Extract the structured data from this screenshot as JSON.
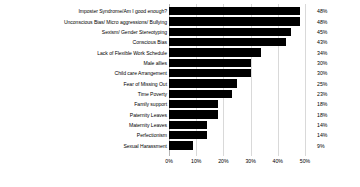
{
  "chart_data": {
    "type": "bar",
    "orientation": "horizontal",
    "title": "",
    "xlabel": "",
    "ylabel": "",
    "xlim": [
      0,
      50
    ],
    "xtick_labels": [
      "0%",
      "10%",
      "20%",
      "30%",
      "40%",
      "50%"
    ],
    "xtick_values": [
      0,
      10,
      20,
      30,
      40,
      50
    ],
    "grid": true,
    "legend": "none",
    "bar_color": "#000000",
    "grid_color": "#d9d9d9",
    "categories": [
      "Imposter Syndrome/Am I good enough?",
      "Unconscious Bias/ Micro aggressions/ Bullying",
      "Sexism/ Gender Stereotyping",
      "Conscious Bias",
      "Lack of Flexible Work Schedule",
      "Male allies",
      "Child care Arrangement",
      "Fear of Missing Out",
      "Time Poverty",
      "Family support",
      "Paternity Leaves",
      "Maternity Leaves",
      "Perfectionism",
      "Sexual Harassment"
    ],
    "values": [
      48,
      48,
      45,
      43,
      34,
      30,
      30,
      25,
      23,
      18,
      18,
      14,
      14,
      9
    ],
    "value_labels": [
      "48%",
      "48%",
      "45%",
      "43%",
      "34%",
      "30%",
      "30%",
      "25%",
      "23%",
      "18%",
      "18%",
      "14%",
      "14%",
      "9%"
    ]
  }
}
